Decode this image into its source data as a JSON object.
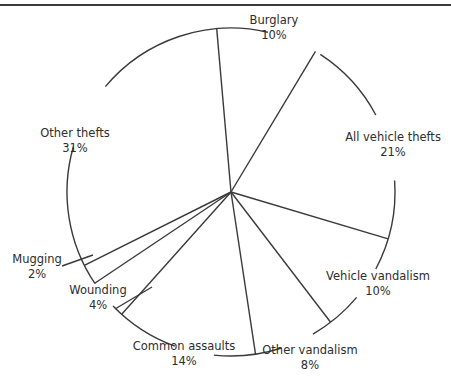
{
  "chart_data": {
    "type": "pie",
    "title": "",
    "start_angle_deg": -5,
    "direction": "clockwise",
    "categories": [
      "Burglary",
      "All vehicle thefts",
      "Vehicle vandalism",
      "Other vandalism",
      "Common assaults",
      "Wounding",
      "Mugging",
      "Other thefts"
    ],
    "values": [
      10,
      21,
      10,
      8,
      14,
      4,
      2,
      31
    ],
    "labels": [
      {
        "name": "Burglary",
        "pct": "10%",
        "x": 274,
        "y": 13
      },
      {
        "name": "All vehicle thefts",
        "pct": "21%",
        "x": 393,
        "y": 130
      },
      {
        "name": "Vehicle vandalism",
        "pct": "10%",
        "x": 378,
        "y": 269
      },
      {
        "name": "Other vandalism",
        "pct": "8%",
        "x": 310,
        "y": 343
      },
      {
        "name": "Common assaults",
        "pct": "14%",
        "x": 184,
        "y": 339
      },
      {
        "name": "Wounding",
        "pct": "4%",
        "x": 98,
        "y": 283
      },
      {
        "name": "Mugging",
        "pct": "2%",
        "x": 37,
        "y": 252
      },
      {
        "name": "Other thefts",
        "pct": "31%",
        "x": 75,
        "y": 126
      }
    ],
    "legend": "none",
    "grid": false
  },
  "geometry": {
    "cx": 231,
    "cy": 192,
    "r": 164,
    "stroke": "#3a3a3a",
    "arc_gaps_deg": [
      [
        13,
        33
      ],
      [
        62,
        86
      ],
      [
        118,
        130
      ],
      [
        150,
        162
      ],
      [
        186,
        200
      ],
      [
        226,
        236
      ],
      [
        286,
        310
      ]
    ]
  }
}
